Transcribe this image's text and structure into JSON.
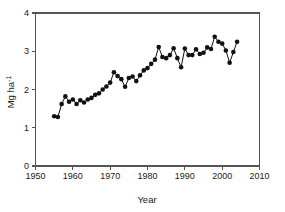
{
  "chart_data": {
    "type": "line",
    "title": "",
    "subtitle": "",
    "xlabel": "Year",
    "ylabel": "Mg ha⁻¹",
    "ylabel_base": "Mg ha",
    "ylabel_exponent": "-1",
    "xlim": [
      1950,
      2010
    ],
    "ylim": [
      0,
      4
    ],
    "xticks": [
      1950,
      1960,
      1970,
      1980,
      1990,
      2000,
      2010
    ],
    "xtick_labels": [
      "1950",
      "1960",
      "1970",
      "1980",
      "1990",
      "2000",
      "2010"
    ],
    "yticks": [
      0,
      1,
      2,
      3,
      4
    ],
    "ytick_labels": [
      "0",
      "1",
      "2",
      "3",
      "4"
    ],
    "grid": false,
    "legend": false,
    "legend_position": "none",
    "marker": "filled-circle",
    "marker_color": "#111111",
    "line_color": "#111111",
    "axis_color": "#555555",
    "background_color": "#ffffff",
    "x": [
      1955,
      1956,
      1957,
      1958,
      1959,
      1960,
      1961,
      1962,
      1963,
      1964,
      1965,
      1966,
      1967,
      1968,
      1969,
      1970,
      1971,
      1972,
      1973,
      1974,
      1975,
      1976,
      1977,
      1978,
      1979,
      1980,
      1981,
      1982,
      1983,
      1984,
      1985,
      1986,
      1987,
      1988,
      1989,
      1990,
      1991,
      1992,
      1993,
      1994,
      1995,
      1996,
      1997,
      1998,
      1999,
      2000,
      2001,
      2002,
      2003,
      2004
    ],
    "values": [
      1.3,
      1.28,
      1.62,
      1.82,
      1.68,
      1.74,
      1.62,
      1.72,
      1.66,
      1.74,
      1.78,
      1.86,
      1.9,
      2.0,
      2.08,
      2.18,
      2.45,
      2.35,
      2.27,
      2.07,
      2.3,
      2.34,
      2.22,
      2.37,
      2.5,
      2.56,
      2.67,
      2.78,
      3.11,
      2.85,
      2.82,
      2.9,
      3.08,
      2.82,
      2.58,
      3.07,
      2.9,
      2.9,
      3.05,
      2.93,
      2.96,
      3.1,
      3.06,
      3.38,
      3.25,
      3.2,
      3.02,
      2.7,
      2.98,
      3.25
    ],
    "series_name": "Yield",
    "annotations": []
  },
  "figure": {
    "axis_tick_length": 4,
    "marker_radius": 2.3
  }
}
